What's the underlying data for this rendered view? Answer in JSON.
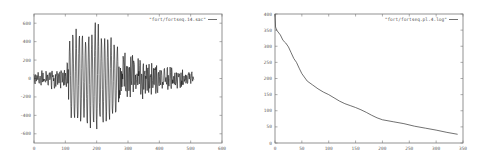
{
  "chart_data": [
    {
      "type": "line",
      "title": "",
      "xlabel": "",
      "ylabel": "",
      "legend": [
        "\"fort/fortseq.14.sac\""
      ],
      "legend_position": "top-right",
      "grid": false,
      "xlim": [
        0,
        600
      ],
      "ylim": [
        -700,
        700
      ],
      "x_ticks": [
        0,
        100,
        200,
        300,
        400,
        500,
        600
      ],
      "y_ticks": [
        600,
        400,
        200,
        0,
        -200,
        -400,
        -600
      ],
      "series": [
        {
          "name": "\"fort/fortseq.14.sac\"",
          "description": "oscillating waveform (seismic trace), small amplitude 0-110, large burst 110-270 peaking near x=200 (~+700/-700), decaying tail to x~510",
          "envelope": {
            "x": [
              0,
              50,
              100,
              110,
              130,
              160,
              190,
              200,
              210,
              240,
              265,
              280,
              300,
              350,
              400,
              450,
              510
            ],
            "amp": [
              60,
              120,
              110,
              400,
              550,
              520,
              580,
              700,
              500,
              480,
              420,
              280,
              300,
              220,
              180,
              120,
              80
            ]
          }
        }
      ]
    },
    {
      "type": "line",
      "title": "",
      "xlabel": "",
      "ylabel": "",
      "legend": [
        "\"fort/fortseq.pl.4.log\""
      ],
      "legend_position": "top-right",
      "grid": false,
      "xlim": [
        0,
        350
      ],
      "ylim": [
        0,
        400
      ],
      "x_ticks": [
        0,
        50,
        100,
        150,
        200,
        250,
        300,
        350
      ],
      "y_ticks": [
        0,
        50,
        100,
        150,
        200,
        250,
        300,
        350,
        400
      ],
      "series": [
        {
          "name": "\"fort/fortseq.pl.4.log\"",
          "x": [
            0,
            1,
            3,
            10,
            15,
            20,
            25,
            30,
            35,
            40,
            45,
            50,
            60,
            70,
            80,
            90,
            100,
            110,
            120,
            130,
            140,
            150,
            160,
            170,
            180,
            190,
            200,
            220,
            240,
            260,
            280,
            300,
            320,
            340
          ],
          "y": [
            400,
            360,
            350,
            335,
            318,
            310,
            298,
            280,
            262,
            250,
            232,
            215,
            192,
            180,
            168,
            158,
            150,
            140,
            130,
            122,
            116,
            110,
            103,
            95,
            86,
            78,
            72,
            66,
            60,
            52,
            46,
            40,
            33,
            27
          ]
        }
      ]
    }
  ]
}
